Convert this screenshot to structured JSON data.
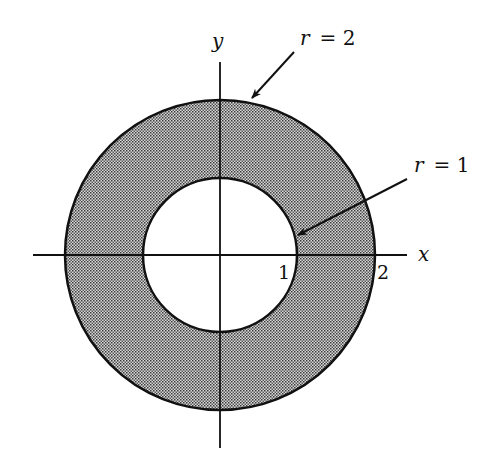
{
  "diagram": {
    "colors": {
      "background": "#ffffff",
      "stroke": "#111111",
      "shade_dark": "#3a3a3a",
      "shade_light": "#d8d8d8"
    },
    "axes": {
      "x_label": "x",
      "y_label": "y"
    },
    "ticks": {
      "inner": "1",
      "outer": "2"
    },
    "annotations": {
      "outer_label_var": "r",
      "outer_label_eq": "= 2",
      "inner_label_var": "r",
      "inner_label_eq": "= 1"
    }
  }
}
